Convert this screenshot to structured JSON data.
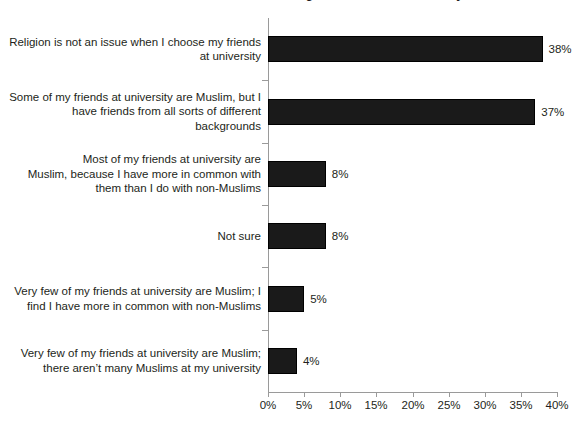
{
  "chart_data": {
    "type": "bar",
    "orientation": "horizontal",
    "title": "Statements about Muslims choosing their friends at university",
    "xlabel": "",
    "ylabel": "",
    "xlim": [
      0,
      40
    ],
    "xtick_labels": [
      "0%",
      "5%",
      "10%",
      "15%",
      "20%",
      "25%",
      "30%",
      "35%",
      "40%"
    ],
    "xtick_values": [
      0,
      5,
      10,
      15,
      20,
      25,
      30,
      35,
      40
    ],
    "grid": false,
    "legend": "none",
    "bar_color": "#1a1a1a",
    "categories": [
      "Religion is not an issue when I choose my friends at university",
      "Some of my friends at university are Muslim, but I have friends from all sorts of different backgrounds",
      "Most of my friends at university are Muslim, because I have more in common with them than I do with non-Muslims",
      "Not sure",
      "Very few of my friends at university are Muslim; I find I have more in common with non-Muslims",
      "Very few of my friends at university are Muslim; there aren’t many Muslims at my university"
    ],
    "category_lines": [
      [
        "Religion is not an issue when I choose my friends",
        "at university"
      ],
      [
        "Some of my friends at university are Muslim, but I",
        "have friends from all sorts of different",
        "backgrounds"
      ],
      [
        "Most of my friends at university are",
        "Muslim, because I have more in common with",
        "them than I do with non-Muslims"
      ],
      [
        "Not sure"
      ],
      [
        "Very few of my friends at university are Muslim; I",
        "find I have more in common with non-Muslims"
      ],
      [
        "Very few of my friends at university are Muslim;",
        "there aren’t many Muslims at my university"
      ]
    ],
    "values": [
      38,
      37,
      8,
      8,
      5,
      4
    ],
    "value_labels": [
      "38%",
      "37%",
      "8%",
      "8%",
      "5%",
      "4%"
    ]
  }
}
